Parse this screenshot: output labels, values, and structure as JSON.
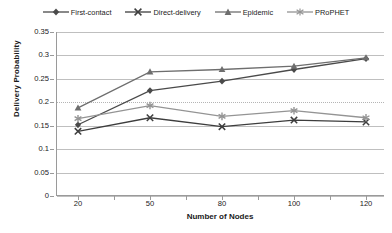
{
  "chart_data": {
    "type": "line",
    "title": "",
    "xlabel": "Number of Nodes",
    "ylabel": "Delivery Probability",
    "categories": [
      20,
      50,
      80,
      100,
      120
    ],
    "xtick_labels": [
      "20",
      "50",
      "80",
      "100",
      "120"
    ],
    "ytick_labels": [
      "0",
      "0.05",
      "0.1",
      "0.15",
      "0.2",
      "0.25",
      "0.3",
      "0.35"
    ],
    "yticks": [
      0,
      0.05,
      0.1,
      0.15,
      0.2,
      0.25,
      0.3,
      0.35
    ],
    "ylim": [
      0,
      0.35
    ],
    "grid": "horizontal",
    "legend_position": "top",
    "series": [
      {
        "name": "First-contact",
        "marker": "diamond",
        "color": "#4a4a4a",
        "values": [
          0.152,
          0.225,
          0.245,
          0.27,
          0.293
        ]
      },
      {
        "name": "Direct-delivery",
        "marker": "x-cross",
        "color": "#3d3d3d",
        "values": [
          0.138,
          0.167,
          0.148,
          0.162,
          0.158
        ]
      },
      {
        "name": "Epidemic",
        "marker": "triangle",
        "color": "#6e6e6e",
        "values": [
          0.188,
          0.265,
          0.27,
          0.277,
          0.295
        ]
      },
      {
        "name": "PRoPHET",
        "marker": "asterisk",
        "color": "#949494",
        "values": [
          0.165,
          0.193,
          0.17,
          0.182,
          0.167
        ]
      }
    ]
  },
  "axes": {
    "y_title": "Delivery Probability",
    "x_title": "Number of Nodes"
  },
  "colors": {
    "gridline": "#bfbfbf",
    "axis": "#9a9a9a",
    "text": "#1a1a1a",
    "background": "#ffffff"
  }
}
